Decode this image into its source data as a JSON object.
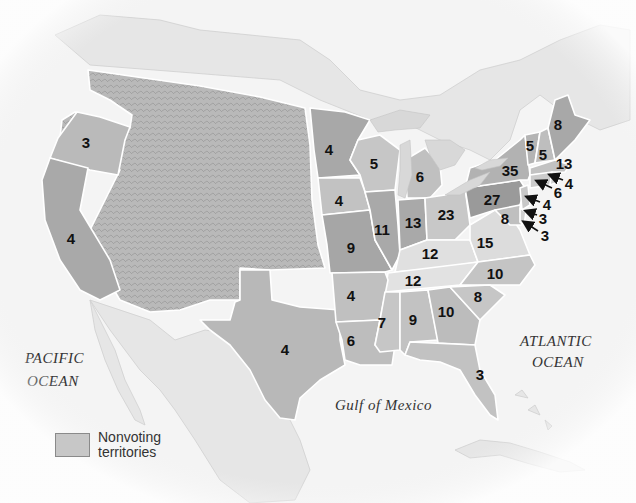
{
  "map": {
    "colors": {
      "nonvoting_territory": "#c4c4c4",
      "state_dark": "#a8a8a8",
      "state_mid": "#bcbcbc",
      "state_light": "#d4d4d4",
      "state_lightest": "#e2e2e2",
      "border": "#ffffff",
      "background": "#f4f4f4"
    },
    "water_labels": {
      "pacific": [
        "PACIFIC",
        "OCEAN"
      ],
      "atlantic": [
        "ATLANTIC",
        "OCEAN"
      ],
      "gulf": "Gulf of Mexico"
    },
    "legend": {
      "label_line1": "Nonvoting",
      "label_line2": "territories"
    },
    "states": [
      {
        "name": "Oregon",
        "votes": "3"
      },
      {
        "name": "California",
        "votes": "4"
      },
      {
        "name": "Minnesota",
        "votes": "4"
      },
      {
        "name": "Wisconsin",
        "votes": "5"
      },
      {
        "name": "Michigan",
        "votes": "6"
      },
      {
        "name": "Iowa",
        "votes": "4"
      },
      {
        "name": "Missouri",
        "votes": "9"
      },
      {
        "name": "Illinois",
        "votes": "11"
      },
      {
        "name": "Indiana",
        "votes": "13"
      },
      {
        "name": "Ohio",
        "votes": "23"
      },
      {
        "name": "Kentucky",
        "votes": "12"
      },
      {
        "name": "Tennessee",
        "votes": "12"
      },
      {
        "name": "Arkansas",
        "votes": "4"
      },
      {
        "name": "Louisiana",
        "votes": "6"
      },
      {
        "name": "Mississippi",
        "votes": "7"
      },
      {
        "name": "Alabama",
        "votes": "9"
      },
      {
        "name": "Georgia",
        "votes": "10"
      },
      {
        "name": "South Carolina",
        "votes": "8"
      },
      {
        "name": "North Carolina",
        "votes": "10"
      },
      {
        "name": "Virginia",
        "votes": "15"
      },
      {
        "name": "Florida",
        "votes": "3"
      },
      {
        "name": "Texas",
        "votes": "4"
      },
      {
        "name": "Pennsylvania",
        "votes": "27"
      },
      {
        "name": "New York",
        "votes": "35"
      },
      {
        "name": "Vermont",
        "votes": "5"
      },
      {
        "name": "New Hampshire",
        "votes": "5"
      },
      {
        "name": "Maine",
        "votes": "8"
      },
      {
        "name": "Massachusetts",
        "votes": "13"
      },
      {
        "name": "Maryland",
        "votes": "8"
      },
      {
        "name": "Rhode Island",
        "votes": "4"
      },
      {
        "name": "Connecticut",
        "votes": "6"
      },
      {
        "name": "New Jersey",
        "votes": "4"
      },
      {
        "name": "Delaware (upper)",
        "votes": "3"
      },
      {
        "name": "Delaware (lower)",
        "votes": "3"
      }
    ]
  }
}
